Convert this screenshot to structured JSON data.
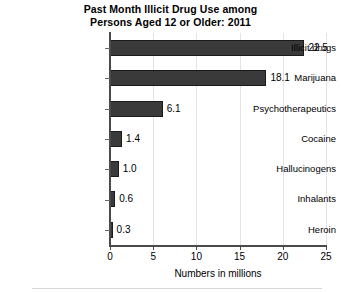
{
  "chart_data": {
    "type": "bar",
    "orientation": "horizontal",
    "title": "Past Month Illicit Drug Use among Persons Aged 12 or Older: 2011",
    "title_lines": [
      "Past Month Illicit Drug Use among",
      "Persons Aged 12 or Older: 2011"
    ],
    "categories": [
      "Illicit drugs",
      "Marijuana",
      "Psychotherapeutics",
      "Cocaine",
      "Hallucinogens",
      "Inhalants",
      "Heroin"
    ],
    "values": [
      22.5,
      18.1,
      6.1,
      1.4,
      1.0,
      0.6,
      0.3
    ],
    "value_labels": [
      "22.5",
      "18.1",
      "6.1",
      "1.4",
      "1.0",
      "0.6",
      "0.3"
    ],
    "xlabel": "Numbers in millions",
    "ylabel": "",
    "xlim": [
      0,
      25
    ],
    "xticks": [
      0,
      5,
      10,
      15,
      20,
      25
    ],
    "xtick_labels": [
      "0",
      "5",
      "10",
      "15",
      "20",
      "25"
    ],
    "grid": "vertical-light",
    "legend": "none",
    "bar_color": "#3a3a3a",
    "bar_edge_color": "#1a1a1a",
    "grid_color": "#e3e3e3",
    "axis_color": "#4a4a4a",
    "background": "#ffffff"
  }
}
